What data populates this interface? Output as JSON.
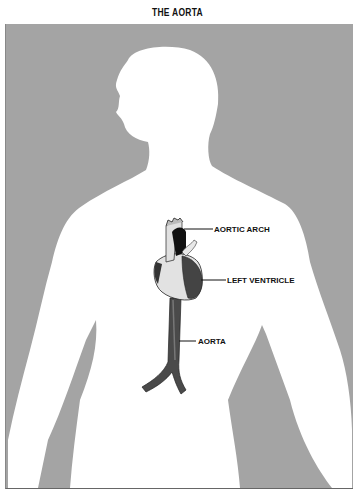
{
  "title": "THE AORTA",
  "colors": {
    "background_panel": "#a4a4a4",
    "silhouette": "#ffffff",
    "vessel_dark": "#3a3a3a",
    "heart_light": "#e6e6e6"
  },
  "labels": {
    "aortic_arch": "AORTIC ARCH",
    "left_ventricle": "LEFT VENTRICLE",
    "aorta": "AORTA"
  }
}
